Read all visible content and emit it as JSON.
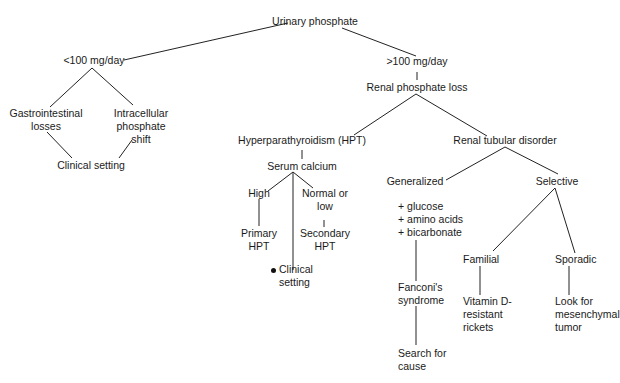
{
  "diagram": {
    "type": "flowchart",
    "title": "Urinary phosphate",
    "nodes": {
      "root": {
        "lines": [
          "Urinary phosphate"
        ]
      },
      "low": {
        "lines": [
          "<100 mg/day"
        ]
      },
      "high": {
        "lines": [
          ">100 mg/day"
        ]
      },
      "gi": {
        "lines": [
          "Gastrointestinal",
          "losses"
        ]
      },
      "intra": {
        "lines": [
          "Intracellular",
          "phosphate",
          "shift"
        ]
      },
      "clinical1": {
        "lines": [
          "Clinical setting"
        ]
      },
      "renal": {
        "lines": [
          "Renal phosphate loss"
        ]
      },
      "hpt": {
        "lines": [
          "Hyperparathyroidism (HPT)"
        ]
      },
      "serum": {
        "lines": [
          "Serum calcium"
        ]
      },
      "highca": {
        "lines": [
          "High"
        ]
      },
      "normal": {
        "lines": [
          "Normal or",
          "low"
        ]
      },
      "primary": {
        "lines": [
          "Primary",
          "HPT"
        ]
      },
      "secondary": {
        "lines": [
          "Secondary",
          "HPT"
        ]
      },
      "clinical2": {
        "lines": [
          "Clinical",
          "setting"
        ],
        "bullet": true
      },
      "rtd": {
        "lines": [
          "Renal tubular disorder"
        ]
      },
      "generalized": {
        "lines": [
          "Generalized"
        ]
      },
      "selective": {
        "lines": [
          "Selective"
        ]
      },
      "markers": {
        "lines": [
          "+  glucose",
          "+  amino acids",
          "+  bicarbonate"
        ]
      },
      "fanconi": {
        "lines": [
          "Fanconi's",
          "syndrome"
        ]
      },
      "search": {
        "lines": [
          "Search for",
          "cause"
        ]
      },
      "familial": {
        "lines": [
          "Familial"
        ]
      },
      "sporadic": {
        "lines": [
          "Sporadic"
        ]
      },
      "vitd": {
        "lines": [
          "Vitamin D-",
          "resistant",
          "rickets"
        ]
      },
      "tumor": {
        "lines": [
          "Look for",
          "mesenchymal",
          "tumor"
        ]
      }
    },
    "edges": [
      [
        "root",
        "low"
      ],
      [
        "root",
        "high"
      ],
      [
        "low",
        "gi"
      ],
      [
        "low",
        "intra"
      ],
      [
        "gi",
        "clinical1"
      ],
      [
        "intra",
        "clinical1"
      ],
      [
        "high",
        "renal"
      ],
      [
        "renal",
        "hpt"
      ],
      [
        "renal",
        "rtd"
      ],
      [
        "hpt",
        "serum"
      ],
      [
        "serum",
        "highca"
      ],
      [
        "serum",
        "normal"
      ],
      [
        "serum",
        "clinical2"
      ],
      [
        "highca",
        "primary"
      ],
      [
        "normal",
        "secondary"
      ],
      [
        "rtd",
        "generalized"
      ],
      [
        "rtd",
        "selective"
      ],
      [
        "markers",
        "fanconi"
      ],
      [
        "fanconi",
        "search"
      ],
      [
        "selective",
        "familial"
      ],
      [
        "selective",
        "sporadic"
      ],
      [
        "familial",
        "vitd"
      ],
      [
        "sporadic",
        "tumor"
      ]
    ]
  }
}
